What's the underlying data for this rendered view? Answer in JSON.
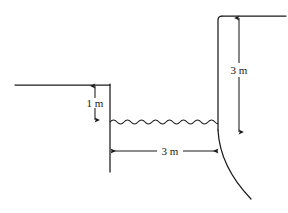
{
  "figure": {
    "background_color": "#ffffff",
    "line_color": "#1a1a1a",
    "labels": {
      "upstream_depth": "1 m",
      "channel_width": "3 m",
      "wall_height": "3 m"
    },
    "elements": {
      "left_ground_line": "upstream-ground-surface",
      "left_wall": "upstream-vertical-wall",
      "water_surface": "wavy-water-line",
      "right_wall": "downstream-vertical-wall",
      "spillway_curve": "curved-spillway-face",
      "right_ground_line": "downstream-ground-surface",
      "vertical_dim_1m": "one-meter-vertical-dimension",
      "horizontal_dim_3m": "three-meter-horizontal-dimension",
      "vertical_dim_3m": "three-meter-vertical-dimension"
    }
  }
}
